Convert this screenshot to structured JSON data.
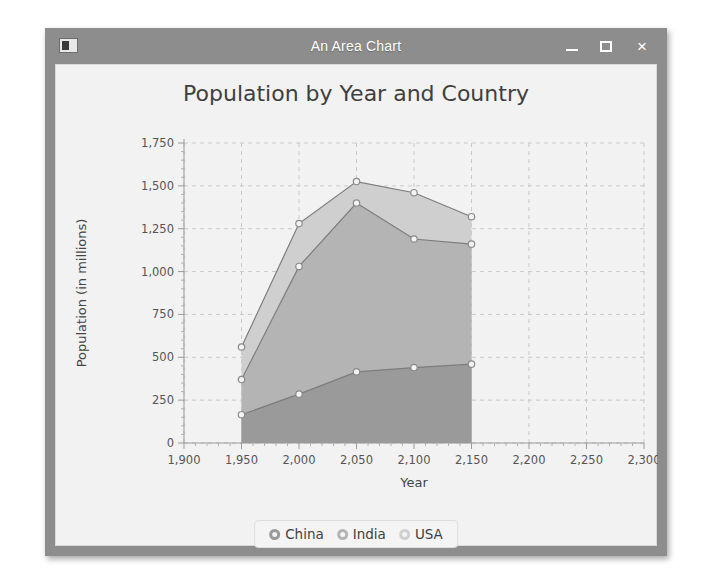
{
  "window": {
    "title": "An Area Chart",
    "icon": "app-window-icon",
    "controls": {
      "minimize": "–",
      "maximize": "□",
      "close": "×"
    }
  },
  "chart_data": {
    "type": "area",
    "title": "Population by Year and Country",
    "xlabel": "Year",
    "ylabel": "Population (in millions)",
    "stacked": true,
    "grid": true,
    "legend_position": "bottom",
    "x": [
      1950,
      2000,
      2050,
      2100,
      2150
    ],
    "xlim": [
      1900,
      2300
    ],
    "ylim": [
      0,
      1750
    ],
    "xticks": [
      "1,900",
      "1,950",
      "2,000",
      "2,050",
      "2,100",
      "2,150",
      "2,200",
      "2,250",
      "2,300"
    ],
    "xtick_values": [
      1900,
      1950,
      2000,
      2050,
      2100,
      2150,
      2200,
      2250,
      2300
    ],
    "yticks": [
      "0",
      "250",
      "500",
      "750",
      "1,000",
      "1,250",
      "1,500",
      "1,750"
    ],
    "ytick_values": [
      0,
      250,
      500,
      750,
      1000,
      1250,
      1500,
      1750
    ],
    "series": [
      {
        "name": "China",
        "color": "#9a9a9a",
        "values": [
          165,
          285,
          415,
          440,
          460
        ],
        "cumulative": [
          165,
          285,
          415,
          440,
          460
        ]
      },
      {
        "name": "India",
        "color": "#b4b4b4",
        "values": [
          205,
          745,
          985,
          750,
          700
        ],
        "cumulative": [
          370,
          1030,
          1400,
          1190,
          1160
        ]
      },
      {
        "name": "USA",
        "color": "#cfcfcf",
        "values": [
          190,
          250,
          125,
          270,
          160
        ],
        "cumulative": [
          560,
          1280,
          1525,
          1460,
          1320
        ]
      }
    ]
  },
  "legend": {
    "items": [
      {
        "label": "China",
        "marker": "circle-marker-china"
      },
      {
        "label": "India",
        "marker": "circle-marker-india"
      },
      {
        "label": "USA",
        "marker": "circle-marker-usa"
      }
    ]
  },
  "colors": {
    "titlebar": "#8d8d8d",
    "client_background": "#f2f2f2",
    "grid": "#c9c9c9",
    "axis": "#9a9a9a",
    "china": "#9a9a9a",
    "india": "#b4b4b4",
    "usa": "#cfcfcf"
  }
}
